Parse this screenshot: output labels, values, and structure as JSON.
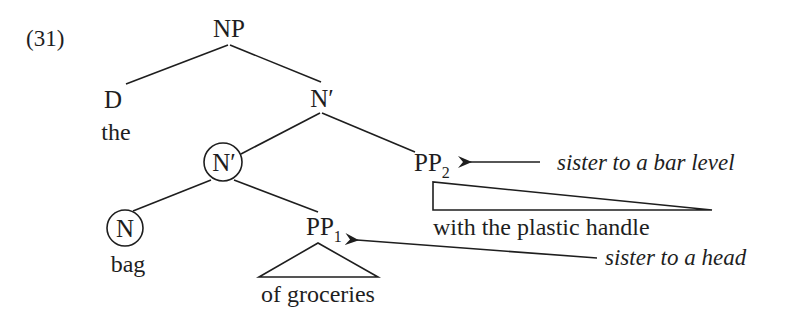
{
  "example": {
    "number": "(31)"
  },
  "tree": {
    "root": "NP",
    "determiner": {
      "label": "D",
      "word": "the"
    },
    "n_bar_upper": {
      "label": "N′"
    },
    "n_bar_lower": {
      "label": "N′",
      "circled": true
    },
    "head_noun": {
      "label": "N",
      "word": "bag",
      "circled": true
    },
    "pp1": {
      "label": "PP",
      "subscript": "1",
      "phrase": "of groceries"
    },
    "pp2": {
      "label": "PP",
      "subscript": "2",
      "phrase": "with the plastic handle"
    }
  },
  "annotations": {
    "pp2_note": "sister to a bar level",
    "pp1_note": "sister to a head"
  },
  "colors": {
    "ink": "#1e1e1e",
    "background": "#ffffff"
  }
}
